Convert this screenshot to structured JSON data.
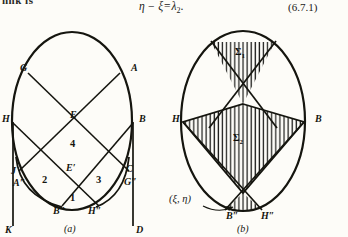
{
  "page": {
    "clipped_text_top_left": "nnk is",
    "equation": {
      "lhs": "η − ξ",
      "rhs": "λ",
      "sub": "2",
      "period": ".",
      "number": "(6.7.1)"
    }
  },
  "figure": {
    "caption_a": "(a)",
    "caption_b": "(b)",
    "diagram_a": {
      "name": "diagram-a",
      "labels": [
        {
          "id": "G",
          "text": "G",
          "x": 20,
          "y": 47
        },
        {
          "id": "A",
          "text": "A",
          "x": 131,
          "y": 47
        },
        {
          "id": "H",
          "text": "H",
          "x": 3,
          "y": 98
        },
        {
          "id": "B",
          "text": "B",
          "x": 140,
          "y": 98
        },
        {
          "id": "E",
          "text": "E",
          "x": 71,
          "y": 95
        },
        {
          "id": "Ep",
          "text": "E′",
          "x": 67,
          "y": 148
        },
        {
          "id": "J",
          "text": "J",
          "x": 12,
          "y": 152
        },
        {
          "id": "C",
          "text": "C",
          "x": 127,
          "y": 150
        },
        {
          "id": "A2",
          "text": "A″",
          "x": 14,
          "y": 164
        },
        {
          "id": "G2",
          "text": "G″",
          "x": 125,
          "y": 163
        },
        {
          "id": "B2",
          "text": "B″",
          "x": 54,
          "y": 192
        },
        {
          "id": "H2",
          "text": "H″",
          "x": 88,
          "y": 192
        },
        {
          "id": "K",
          "text": "K",
          "x": 6,
          "y": 211
        },
        {
          "id": "D",
          "text": "D",
          "x": 137,
          "y": 211
        }
      ],
      "region_numbers": [
        {
          "id": "r4",
          "text": "4",
          "x": 71,
          "y": 124
        },
        {
          "id": "r2",
          "text": "2",
          "x": 43,
          "y": 160
        },
        {
          "id": "r3",
          "text": "3",
          "x": 97,
          "y": 160
        },
        {
          "id": "r1",
          "text": "1",
          "x": 71,
          "y": 178
        }
      ]
    },
    "diagram_b": {
      "name": "diagram-b",
      "labels": [
        {
          "id": "H",
          "text": "H",
          "x": 172,
          "y": 98
        },
        {
          "id": "B",
          "text": "B",
          "x": 316,
          "y": 98
        },
        {
          "id": "B2",
          "text": "B″",
          "x": 227,
          "y": 197
        },
        {
          "id": "H2",
          "text": "H″",
          "x": 262,
          "y": 197
        }
      ],
      "regions": [
        {
          "id": "sigma1",
          "symbol": "Σ",
          "sub": "1",
          "x": 237,
          "y": 32
        },
        {
          "id": "sigma2",
          "symbol": "Σ",
          "sub": "2",
          "x": 234,
          "y": 118
        }
      ],
      "point_label": {
        "id": "xi-eta",
        "text": "(ξ, η)",
        "x": 170,
        "y": 180
      }
    }
  },
  "colors": {
    "ink": "#15150f",
    "paper": "#fdfcf8",
    "hatch": "#1a1a18"
  }
}
